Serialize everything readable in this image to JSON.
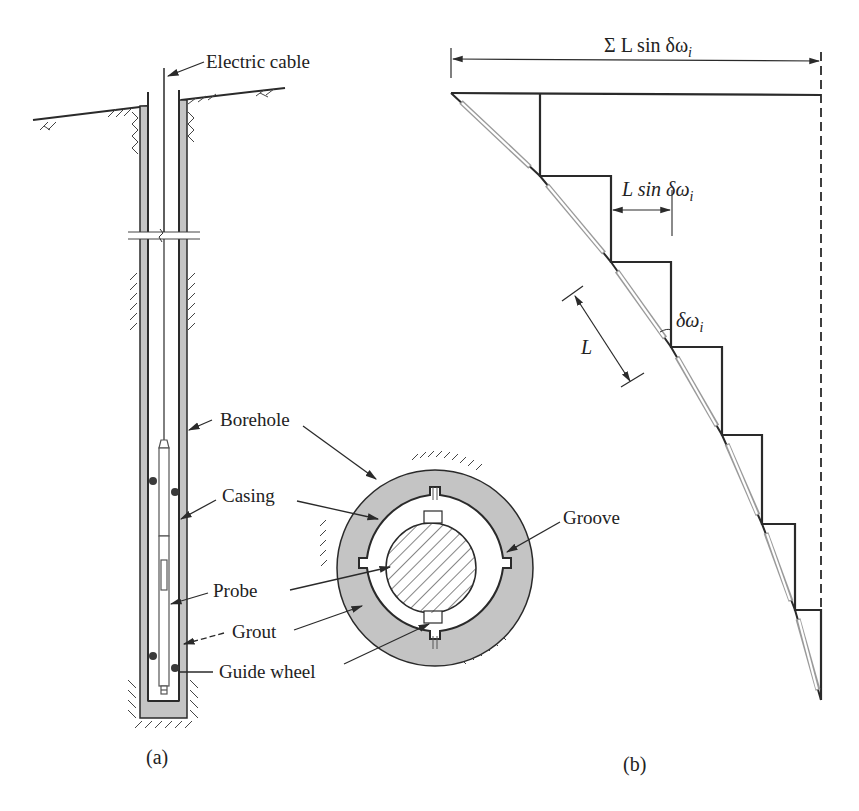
{
  "figure": {
    "panel_a": {
      "caption": "(a)",
      "labels": {
        "electric_cable": "Electric cable",
        "borehole": "Borehole",
        "casing": "Casing",
        "probe": "Probe",
        "grout": "Grout",
        "guide_wheel": "Guide wheel",
        "groove": "Groove"
      }
    },
    "panel_b": {
      "caption": "(b)",
      "labels": {
        "total_deflection": "Σ L sin δω",
        "total_deflection_sub": "i",
        "step_deflection": "L sin δω",
        "step_deflection_sub": "i",
        "angle": "δω",
        "angle_sub": "i",
        "segment_length": "L"
      },
      "staircase_points": [
        [
          451,
          93
        ],
        [
          540,
          176
        ],
        [
          611,
          262
        ],
        [
          671,
          347
        ],
        [
          722,
          435
        ],
        [
          762,
          524
        ],
        [
          795,
          610
        ],
        [
          821,
          700
        ]
      ],
      "reference_line_x": 821
    },
    "colors": {
      "line": "#2a2a2a",
      "grout": "#c4c4c4",
      "probe_outline": "#8a8a8a"
    }
  }
}
